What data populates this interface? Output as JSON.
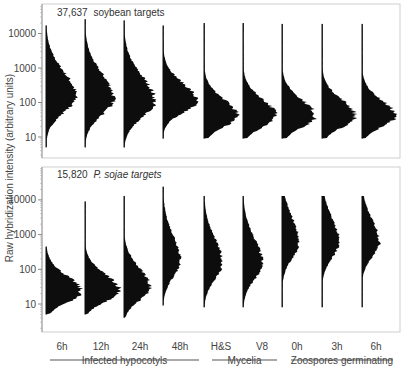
{
  "chart_data": {
    "type": "histogram-violin",
    "title": "",
    "ylabel": "Raw hybridization intensity (arbitrary units)",
    "yscale": "log",
    "yticks": [
      10,
      100,
      1000,
      10000
    ],
    "categories": [
      "6h",
      "12h",
      "24h",
      "48h",
      "H&S",
      "V8",
      "0h",
      "3h",
      "6h"
    ],
    "groups": [
      {
        "label": "Infected hypocotyls",
        "categories": [
          "6h",
          "12h",
          "24h",
          "48h"
        ]
      },
      {
        "label": "Mycelia",
        "categories": [
          "H&S",
          "V8"
        ]
      },
      {
        "label": "Zoospores germinating",
        "categories": [
          "0h",
          "3h",
          "6h"
        ]
      }
    ],
    "panels": [
      {
        "label_count": "37,637",
        "label_text": "soybean targets",
        "label_italic": false,
        "ylim": [
          2,
          40000
        ],
        "series": [
          {
            "category": "6h",
            "mode": 150,
            "min": 5,
            "max": 17000,
            "width": 0.85,
            "spread": 0.62
          },
          {
            "category": "12h",
            "mode": 130,
            "min": 5,
            "max": 26000,
            "width": 0.82,
            "spread": 0.62
          },
          {
            "category": "24h",
            "mode": 110,
            "min": 5,
            "max": 24000,
            "width": 0.88,
            "spread": 0.62
          },
          {
            "category": "48h",
            "mode": 110,
            "min": 9,
            "max": 17000,
            "width": 0.95,
            "spread": 0.45
          },
          {
            "category": "H&S",
            "mode": 40,
            "min": 9,
            "max": 20000,
            "width": 0.95,
            "spread": 0.42
          },
          {
            "category": "V8",
            "mode": 40,
            "min": 9,
            "max": 20000,
            "width": 0.95,
            "spread": 0.42
          },
          {
            "category": "0h",
            "mode": 40,
            "min": 9,
            "max": 19000,
            "width": 0.95,
            "spread": 0.42
          },
          {
            "category": "3h",
            "mode": 40,
            "min": 9,
            "max": 19000,
            "width": 0.95,
            "spread": 0.42
          },
          {
            "category": "6h",
            "mode": 40,
            "min": 9,
            "max": 19000,
            "width": 0.95,
            "spread": 0.4
          }
        ]
      },
      {
        "label_count": "15,820",
        "label_text": "P. sojae targets",
        "label_italic": true,
        "ylim": [
          2,
          40000
        ],
        "series": [
          {
            "category": "6h",
            "mode": 22,
            "min": 5,
            "max": 450,
            "width": 1.0,
            "spread": 0.4
          },
          {
            "category": "12h",
            "mode": 24,
            "min": 5,
            "max": 9000,
            "width": 1.0,
            "spread": 0.4
          },
          {
            "category": "24h",
            "mode": 30,
            "min": 4,
            "max": 13000,
            "width": 0.75,
            "spread": 0.48
          },
          {
            "category": "48h",
            "mode": 180,
            "min": 9,
            "max": 24000,
            "width": 0.5,
            "spread": 0.62
          },
          {
            "category": "H&S",
            "mode": 150,
            "min": 8,
            "max": 13000,
            "width": 0.52,
            "spread": 0.62
          },
          {
            "category": "V8",
            "mode": 150,
            "min": 8,
            "max": 13000,
            "width": 0.55,
            "spread": 0.62
          },
          {
            "category": "0h",
            "mode": 600,
            "min": 8,
            "max": 13000,
            "width": 0.48,
            "spread": 0.62
          },
          {
            "category": "3h",
            "mode": 600,
            "min": 8,
            "max": 13000,
            "width": 0.48,
            "spread": 0.6
          },
          {
            "category": "6h",
            "mode": 600,
            "min": 8,
            "max": 13000,
            "width": 0.5,
            "spread": 0.55
          }
        ]
      }
    ],
    "grid": false,
    "legend": null
  },
  "colors": {
    "fill": "#0d0d0d",
    "frame": "#c8c8c8",
    "text": "#444444"
  }
}
